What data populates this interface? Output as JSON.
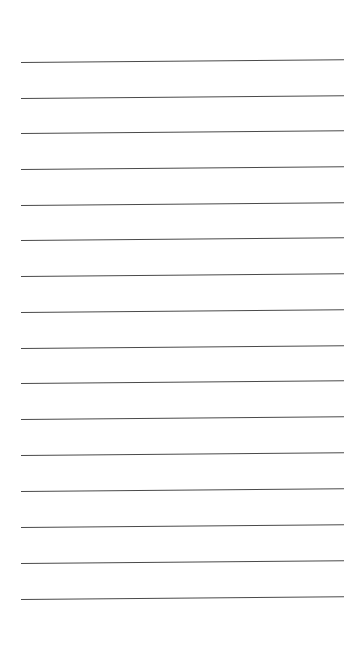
{
  "page": {
    "type": "lined-paper",
    "background": "#ffffff",
    "line_color": "#4a4a4a",
    "line_count": 16,
    "lines": [
      {
        "y": 62
      },
      {
        "y": 98
      },
      {
        "y": 133
      },
      {
        "y": 169
      },
      {
        "y": 205
      },
      {
        "y": 240
      },
      {
        "y": 276
      },
      {
        "y": 312
      },
      {
        "y": 348
      },
      {
        "y": 383
      },
      {
        "y": 419
      },
      {
        "y": 455
      },
      {
        "y": 491
      },
      {
        "y": 527
      },
      {
        "y": 563
      },
      {
        "y": 599
      }
    ]
  }
}
